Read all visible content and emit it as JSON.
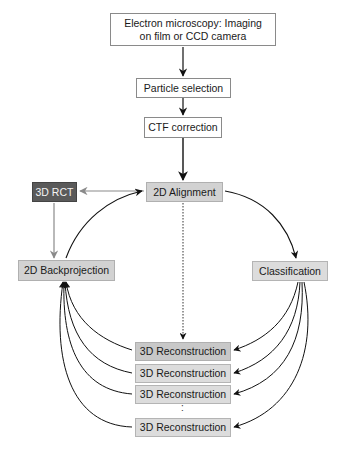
{
  "diagram": {
    "nodes": {
      "em": {
        "label": "Electron microscopy: Imaging on film or CCD camera",
        "line1": "Electron microscopy: Imaging",
        "line2": "on film or CCD camera",
        "fill": "#ffffff"
      },
      "particle": {
        "label": "Particle selection",
        "fill": "#ffffff"
      },
      "ctf": {
        "label": "CTF correction",
        "fill": "#ffffff"
      },
      "rct": {
        "label": "3D RCT",
        "fill": "#5a5a5a"
      },
      "align": {
        "label": "2D Alignment",
        "fill": "#d2d2d2"
      },
      "backproj": {
        "label": "2D Backprojection",
        "fill": "#d2d2d2"
      },
      "classif": {
        "label": "Classification",
        "fill": "#dcdcdc"
      },
      "recon": [
        {
          "label": "3D Reconstruction",
          "fill": "#c8c8c8"
        },
        {
          "label": "3D Reconstruction",
          "fill": "#dcdcdc"
        },
        {
          "label": "3D Reconstruction",
          "fill": "#dcdcdc"
        },
        {
          "label": "3D Reconstruction",
          "fill": "#dcdcdc"
        }
      ],
      "ellipsis": ":"
    },
    "edges": [
      {
        "from": "em",
        "to": "particle",
        "style": "solid"
      },
      {
        "from": "particle",
        "to": "ctf",
        "style": "solid"
      },
      {
        "from": "ctf",
        "to": "align",
        "style": "solid"
      },
      {
        "from": "align",
        "to": "rct",
        "style": "solid-gray"
      },
      {
        "from": "rct",
        "to": "backproj",
        "style": "solid-gray"
      },
      {
        "from": "backproj",
        "to": "align",
        "style": "curved"
      },
      {
        "from": "align",
        "to": "classif",
        "style": "curved"
      },
      {
        "from": "align",
        "to": "recon",
        "style": "dotted"
      },
      {
        "from": "classif",
        "to": "recon",
        "style": "curved",
        "count": 4
      },
      {
        "from": "recon",
        "to": "backproj",
        "style": "curved",
        "count": 4
      }
    ]
  }
}
